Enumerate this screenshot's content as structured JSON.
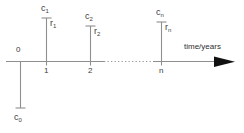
{
  "diagram": {
    "axis": {
      "caption": "time/years",
      "arrow_icon": "right-arrow-icon",
      "tick_labels": [
        "0",
        "1",
        "2",
        "n"
      ],
      "dotted_gap_between": [
        "2",
        "n"
      ]
    },
    "origin_flow": {
      "main": "c",
      "sub": "0",
      "direction": "down"
    },
    "flows": [
      {
        "cash_main": "c",
        "cash_sub": "1",
        "rate_main": "r",
        "rate_sub": "1",
        "tick": "1",
        "direction": "up"
      },
      {
        "cash_main": "c",
        "cash_sub": "2",
        "rate_main": "r",
        "rate_sub": "2",
        "tick": "2",
        "direction": "up"
      },
      {
        "cash_main": "c",
        "cash_sub": "n",
        "rate_main": "r",
        "rate_sub": "n",
        "tick": "n",
        "direction": "up"
      }
    ],
    "colors": {
      "line": "#8a8a8a",
      "arrowhead": "#111111",
      "text": "#404040",
      "background": "#ffffff"
    }
  }
}
